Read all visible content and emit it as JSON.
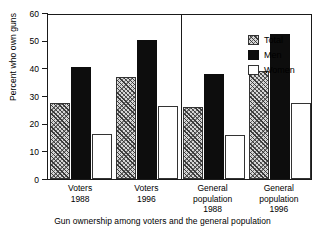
{
  "chart_data": {
    "type": "bar",
    "title": "",
    "caption": "Gun ownership among voters and the general population",
    "xlabel": "",
    "ylabel": "Percent who own guns",
    "ylim": [
      0,
      60
    ],
    "yticks": [
      0,
      10,
      20,
      30,
      40,
      50,
      60
    ],
    "grid": false,
    "legend_position": "top-right",
    "categories": [
      "Voters 1988",
      "Voters 1996",
      "General population 1988",
      "General population 1996"
    ],
    "category_lines": [
      [
        "Voters",
        "1988"
      ],
      [
        "Voters",
        "1996"
      ],
      [
        "General",
        "population",
        "1988"
      ],
      [
        "General",
        "population",
        "1996"
      ]
    ],
    "series": [
      {
        "name": "Total",
        "values": [
          27.5,
          37.0,
          26.0,
          39.2
        ]
      },
      {
        "name": "Men",
        "values": [
          40.4,
          50.3,
          38.1,
          52.3
        ]
      },
      {
        "name": "Women",
        "values": [
          16.1,
          26.4,
          16.0,
          27.5
        ]
      }
    ],
    "panel_divider_after_category": 2,
    "colors": {
      "total": "#d7d7d7",
      "men": "#0d0d0d",
      "women": "#ffffff",
      "axis": "#1a1a1a"
    }
  }
}
